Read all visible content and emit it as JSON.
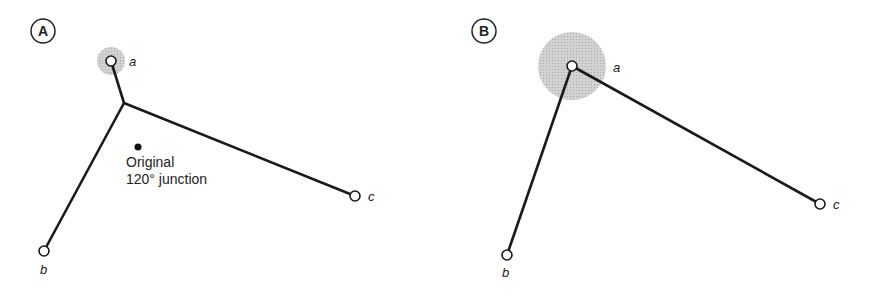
{
  "panels": [
    {
      "label": "A",
      "nodes": [
        {
          "name": "a",
          "x": 111,
          "y": 61
        },
        {
          "name": "b",
          "x": 44,
          "y": 251
        },
        {
          "name": "c",
          "x": 355,
          "y": 196
        }
      ],
      "junction": {
        "x": 124,
        "y": 103
      },
      "halo": {
        "node": "a",
        "radius": 14
      },
      "original_junction": {
        "x": 138,
        "y": 149,
        "label_line1": "Original",
        "label_line2": "120° junction"
      }
    },
    {
      "label": "B",
      "nodes": [
        {
          "name": "a",
          "x": 572,
          "y": 66
        },
        {
          "name": "b",
          "x": 507,
          "y": 255
        },
        {
          "name": "c",
          "x": 820,
          "y": 204
        }
      ],
      "halo": {
        "node": "a",
        "radius": 34
      }
    }
  ],
  "colors": {
    "line": "#1a1a1a",
    "halo": "#c8c8c8"
  }
}
